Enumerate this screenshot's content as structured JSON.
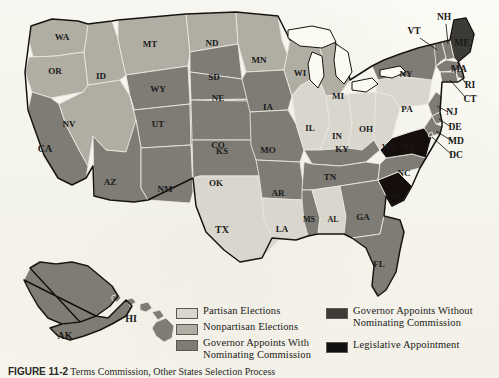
{
  "figure": {
    "caption_label": "FIGURE 11-2",
    "caption_text": "Terms Commission, Other States Selection Process"
  },
  "legend": {
    "items": [
      {
        "label": "Partisan Elections",
        "color": "#d9d7cd",
        "key": "partisan"
      },
      {
        "label": "Nonpartisan Elections",
        "color": "#b0aea3",
        "key": "nonpartisan"
      },
      {
        "label": "Governor Appoints With\nNominating Commission",
        "color": "#7e7c74",
        "key": "gov_with"
      },
      {
        "label": "Governor Appoints Without\nNominating Commission",
        "color": "#3d3b36",
        "key": "gov_without"
      },
      {
        "label": "Legislative Appointment",
        "color": "#121110",
        "key": "legislative"
      }
    ]
  },
  "map": {
    "background_color": "#fbfaf3",
    "border_color": "#1a1a1a",
    "inset_labels": [
      "AK",
      "HI"
    ],
    "states": [
      {
        "abbr": "WA",
        "category": "nonpartisan"
      },
      {
        "abbr": "OR",
        "category": "nonpartisan"
      },
      {
        "abbr": "ID",
        "category": "nonpartisan"
      },
      {
        "abbr": "MT",
        "category": "nonpartisan"
      },
      {
        "abbr": "ND",
        "category": "nonpartisan"
      },
      {
        "abbr": "MN",
        "category": "nonpartisan"
      },
      {
        "abbr": "WI",
        "category": "nonpartisan"
      },
      {
        "abbr": "MI",
        "category": "nonpartisan"
      },
      {
        "abbr": "NV",
        "category": "nonpartisan"
      },
      {
        "abbr": "CA",
        "category": "gov_with"
      },
      {
        "abbr": "WY",
        "category": "gov_with"
      },
      {
        "abbr": "UT",
        "category": "gov_with"
      },
      {
        "abbr": "CO",
        "category": "gov_with"
      },
      {
        "abbr": "AZ",
        "category": "gov_with"
      },
      {
        "abbr": "NM",
        "category": "gov_with"
      },
      {
        "abbr": "SD",
        "category": "gov_with"
      },
      {
        "abbr": "NE",
        "category": "gov_with"
      },
      {
        "abbr": "KS",
        "category": "gov_with"
      },
      {
        "abbr": "OK",
        "category": "gov_with"
      },
      {
        "abbr": "IA",
        "category": "gov_with"
      },
      {
        "abbr": "MO",
        "category": "gov_with"
      },
      {
        "abbr": "AR",
        "category": "gov_with"
      },
      {
        "abbr": "MS",
        "category": "gov_with"
      },
      {
        "abbr": "TN",
        "category": "gov_with"
      },
      {
        "abbr": "KY",
        "category": "gov_with"
      },
      {
        "abbr": "NC",
        "category": "gov_with"
      },
      {
        "abbr": "GA",
        "category": "gov_with"
      },
      {
        "abbr": "FL",
        "category": "gov_with"
      },
      {
        "abbr": "NY",
        "category": "gov_with"
      },
      {
        "abbr": "VT",
        "category": "gov_with"
      },
      {
        "abbr": "NH",
        "category": "gov_with"
      },
      {
        "abbr": "MA",
        "category": "gov_with"
      },
      {
        "abbr": "RI",
        "category": "gov_with"
      },
      {
        "abbr": "CT",
        "category": "gov_with"
      },
      {
        "abbr": "NJ",
        "category": "gov_with"
      },
      {
        "abbr": "DE",
        "category": "gov_with"
      },
      {
        "abbr": "MD",
        "category": "gov_with"
      },
      {
        "abbr": "DC",
        "category": "gov_with"
      },
      {
        "abbr": "AK",
        "category": "gov_with"
      },
      {
        "abbr": "HI",
        "category": "gov_with"
      },
      {
        "abbr": "IL",
        "category": "partisan"
      },
      {
        "abbr": "IN",
        "category": "partisan"
      },
      {
        "abbr": "OH",
        "category": "partisan"
      },
      {
        "abbr": "PA",
        "category": "partisan"
      },
      {
        "abbr": "TX",
        "category": "partisan"
      },
      {
        "abbr": "LA",
        "category": "partisan"
      },
      {
        "abbr": "AL",
        "category": "partisan"
      },
      {
        "abbr": "WV",
        "category": "partisan"
      },
      {
        "abbr": "ME",
        "category": "gov_without"
      },
      {
        "abbr": "VA",
        "category": "legislative"
      },
      {
        "abbr": "SC",
        "category": "legislative"
      }
    ]
  },
  "chart_data": {
    "type": "map",
    "categories": [
      "Partisan Elections",
      "Nonpartisan Elections",
      "Governor Appoints With Nominating Commission",
      "Governor Appoints Without Nominating Commission",
      "Legislative Appointment"
    ],
    "counts": [
      8,
      9,
      32,
      1,
      2
    ],
    "values": {
      "Partisan Elections": [
        "IL",
        "IN",
        "OH",
        "PA",
        "TX",
        "LA",
        "AL",
        "WV"
      ],
      "Nonpartisan Elections": [
        "WA",
        "OR",
        "ID",
        "MT",
        "ND",
        "MN",
        "WI",
        "MI",
        "NV"
      ],
      "Governor Appoints With Nominating Commission": [
        "CA",
        "AK",
        "HI",
        "WY",
        "UT",
        "CO",
        "AZ",
        "NM",
        "SD",
        "NE",
        "KS",
        "OK",
        "IA",
        "MO",
        "AR",
        "MS",
        "TN",
        "KY",
        "NC",
        "GA",
        "FL",
        "NY",
        "VT",
        "NH",
        "MA",
        "RI",
        "CT",
        "NJ",
        "DE",
        "MD",
        "DC"
      ],
      "Governor Appoints Without Nominating Commission": [
        "ME"
      ],
      "Legislative Appointment": [
        "VA",
        "SC"
      ]
    },
    "legend_position": "bottom",
    "grid": false
  }
}
